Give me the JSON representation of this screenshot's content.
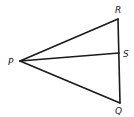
{
  "diagram": {
    "type": "geometry-figure",
    "stroke_color": "#1a1a1a",
    "points": {
      "P": {
        "label": "P",
        "x": 20,
        "y": 61
      },
      "R": {
        "label": "R",
        "x": 118,
        "y": 19
      },
      "S": {
        "label": "S",
        "x": 119,
        "y": 53
      },
      "Q": {
        "label": "Q",
        "x": 120,
        "y": 103
      }
    },
    "segments": [
      {
        "from": "P",
        "to": "R"
      },
      {
        "from": "P",
        "to": "S"
      },
      {
        "from": "P",
        "to": "Q"
      },
      {
        "from": "R",
        "to": "Q"
      }
    ],
    "labels": {
      "P": "P",
      "R": "R",
      "S": "S",
      "Q": "Q"
    }
  }
}
